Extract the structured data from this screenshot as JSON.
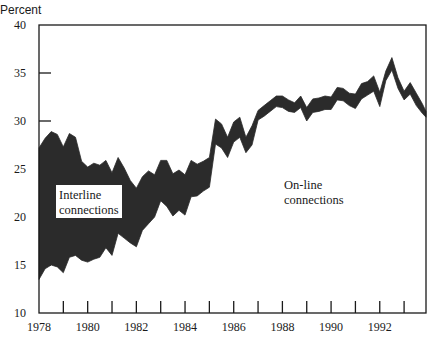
{
  "chart_data": {
    "type": "area",
    "title": "",
    "ylabel": "Percent",
    "xlabel": "",
    "ylim": [
      10,
      40
    ],
    "xlim": [
      1978,
      1993.9
    ],
    "grid": false,
    "yticks": [
      10,
      15,
      20,
      25,
      30,
      35,
      40
    ],
    "xticks": [
      1978,
      1980,
      1982,
      1984,
      1986,
      1988,
      1990,
      1992
    ],
    "xtick_labels": [
      "1978",
      "1980",
      "1982",
      "1984",
      "1986",
      "1988",
      "1990",
      "1992"
    ],
    "ytick_labels": [
      "10",
      "15",
      "20",
      "25",
      "30",
      "35",
      "40"
    ],
    "annotations": [
      {
        "text": "Interline connections",
        "region": "band (dark shaded, between lines)",
        "boxed": true
      },
      {
        "text": "On-line connections",
        "region": "below lower line"
      }
    ],
    "series": [
      {
        "name": "Total (on-line + interline) — upper edge",
        "x": [
          1978.0,
          1978.25,
          1978.5,
          1978.75,
          1979.0,
          1979.25,
          1979.5,
          1979.75,
          1980.0,
          1980.25,
          1980.5,
          1980.75,
          1981.0,
          1981.25,
          1981.5,
          1981.75,
          1982.0,
          1982.25,
          1982.5,
          1982.75,
          1983.0,
          1983.25,
          1983.5,
          1983.75,
          1984.0,
          1984.25,
          1984.5,
          1984.75,
          1985.0,
          1985.25,
          1985.5,
          1985.75,
          1986.0,
          1986.25,
          1986.5,
          1986.75,
          1987.0,
          1987.25,
          1987.5,
          1987.75,
          1988.0,
          1988.25,
          1988.5,
          1988.75,
          1989.0,
          1989.25,
          1989.5,
          1989.75,
          1990.0,
          1990.25,
          1990.5,
          1990.75,
          1991.0,
          1991.25,
          1991.5,
          1991.75,
          1992.0,
          1992.25,
          1992.5,
          1992.75,
          1993.0,
          1993.25,
          1993.5,
          1993.75,
          1993.9
        ],
        "values": [
          27.2,
          28.2,
          28.9,
          28.6,
          27.3,
          28.7,
          28.3,
          25.8,
          25.2,
          25.6,
          25.4,
          25.9,
          24.6,
          26.2,
          25.1,
          23.8,
          23.0,
          24.2,
          24.8,
          24.4,
          25.9,
          25.9,
          24.5,
          24.9,
          24.4,
          25.9,
          25.5,
          25.8,
          26.2,
          30.2,
          29.7,
          28.3,
          29.9,
          30.4,
          28.3,
          29.5,
          31.1,
          31.6,
          32.1,
          32.6,
          32.6,
          32.2,
          31.9,
          32.6,
          31.4,
          32.3,
          32.4,
          32.6,
          32.5,
          33.5,
          33.4,
          32.9,
          32.8,
          33.9,
          34.1,
          34.7,
          33.0,
          35.2,
          36.6,
          34.5,
          33.1,
          34.0,
          32.9,
          31.8,
          31.0
        ],
        "color": "#2b2b2b"
      },
      {
        "name": "On-line connections — lower edge",
        "x": [
          1978.0,
          1978.25,
          1978.5,
          1978.75,
          1979.0,
          1979.25,
          1979.5,
          1979.75,
          1980.0,
          1980.25,
          1980.5,
          1980.75,
          1981.0,
          1981.25,
          1981.5,
          1981.75,
          1982.0,
          1982.25,
          1982.5,
          1982.75,
          1983.0,
          1983.25,
          1983.5,
          1983.75,
          1984.0,
          1984.25,
          1984.5,
          1984.75,
          1985.0,
          1985.25,
          1985.5,
          1985.75,
          1986.0,
          1986.25,
          1986.5,
          1986.75,
          1987.0,
          1987.25,
          1987.5,
          1987.75,
          1988.0,
          1988.25,
          1988.5,
          1988.75,
          1989.0,
          1989.25,
          1989.5,
          1989.75,
          1990.0,
          1990.25,
          1990.5,
          1990.75,
          1991.0,
          1991.25,
          1991.5,
          1991.75,
          1992.0,
          1992.25,
          1992.5,
          1992.75,
          1993.0,
          1993.25,
          1993.5,
          1993.75,
          1993.9
        ],
        "values": [
          13.5,
          14.6,
          15.0,
          14.8,
          14.2,
          15.8,
          16.0,
          15.5,
          15.3,
          15.6,
          15.8,
          16.8,
          16.0,
          18.3,
          17.8,
          17.3,
          16.9,
          18.6,
          19.3,
          20.0,
          21.7,
          21.1,
          20.1,
          20.7,
          20.2,
          22.1,
          22.2,
          22.7,
          23.1,
          27.6,
          27.2,
          26.2,
          27.8,
          28.3,
          26.7,
          27.5,
          30.1,
          30.5,
          31.0,
          31.5,
          31.4,
          31.0,
          30.9,
          31.4,
          30.0,
          30.9,
          31.0,
          31.2,
          31.2,
          32.2,
          32.1,
          31.6,
          31.3,
          32.3,
          32.7,
          33.1,
          31.5,
          34.2,
          35.3,
          33.4,
          32.2,
          32.8,
          31.6,
          30.8,
          30.4
        ],
        "color": "#2b2b2b"
      }
    ]
  },
  "labels": {
    "y_axis_title": "Percent",
    "interline": [
      "Interline",
      "connections"
    ],
    "online": [
      "On-line",
      "connections"
    ]
  },
  "colors": {
    "band_fill": "#2b2b2b",
    "axis": "#1a1a1a",
    "background": "#ffffff",
    "label_box": "#ffffff"
  }
}
